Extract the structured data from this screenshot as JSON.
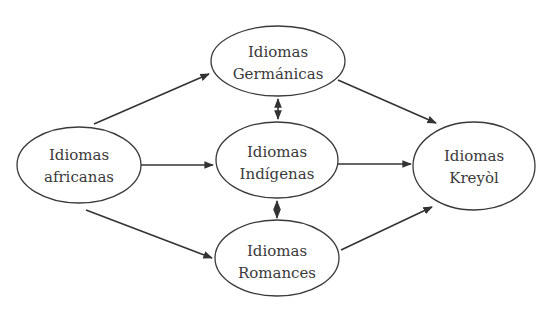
{
  "diagram": {
    "type": "flow",
    "nodes": [
      {
        "id": "africanas",
        "line1": "Idiomas",
        "line2": "africanas"
      },
      {
        "id": "germanicas",
        "line1": "Idiomas",
        "line2": "Germánicas"
      },
      {
        "id": "indigenas",
        "line1": "Idiomas",
        "line2": "Indígenas"
      },
      {
        "id": "romances",
        "line1": "Idiomas",
        "line2": "Romances"
      },
      {
        "id": "kreyol",
        "line1": "Idiomas",
        "line2": "Kreyòl"
      }
    ],
    "edges": [
      {
        "from": "africanas",
        "to": "germanicas",
        "direction": "forward"
      },
      {
        "from": "africanas",
        "to": "indigenas",
        "direction": "forward"
      },
      {
        "from": "africanas",
        "to": "romances",
        "direction": "forward"
      },
      {
        "from": "germanicas",
        "to": "kreyol",
        "direction": "forward"
      },
      {
        "from": "indigenas",
        "to": "kreyol",
        "direction": "forward"
      },
      {
        "from": "romances",
        "to": "kreyol",
        "direction": "forward"
      },
      {
        "from": "germanicas",
        "to": "indigenas",
        "direction": "both"
      },
      {
        "from": "indigenas",
        "to": "romances",
        "direction": "both"
      }
    ],
    "colors": {
      "stroke": "#333333",
      "text": "#3a3a3a",
      "background": "#ffffff"
    }
  }
}
